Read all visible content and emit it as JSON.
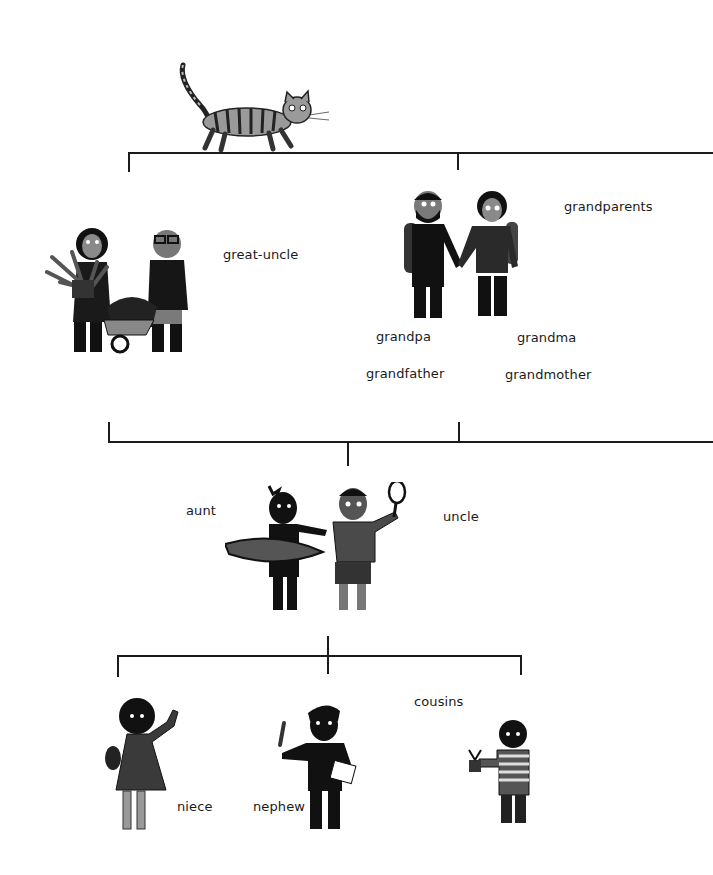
{
  "diagram": {
    "type": "family-tree",
    "style": "black-and-white illustration",
    "labels": {
      "great_uncle": "great-uncle",
      "grandparents": "grandparents",
      "grandpa": "grandpa",
      "grandfather": "grandfather",
      "grandma": "grandma",
      "grandmother": "grandmother",
      "aunt": "aunt",
      "uncle": "uncle",
      "cousins": "cousins",
      "niece": "niece",
      "nephew": "nephew"
    },
    "illustrations": [
      {
        "id": "cat",
        "description": "striped tabby cat walking"
      },
      {
        "id": "great-uncle-couple",
        "description": "woman holding a plant and man with glasses pushing a wheelbarrow"
      },
      {
        "id": "grandparents",
        "description": "bearded man and curly-haired woman holding hands, wearing backpacks"
      },
      {
        "id": "aunt-uncle",
        "description": "woman in wetsuit holding surfboard and man holding a tennis racket"
      },
      {
        "id": "niece",
        "description": "girl in dress waving"
      },
      {
        "id": "nephew",
        "description": "boy holding a pencil and paper"
      },
      {
        "id": "cousin",
        "description": "boy in striped shirt holding a potted plant"
      }
    ],
    "colors": {
      "ink": "#1b1b1b",
      "background": "#ffffff"
    }
  }
}
